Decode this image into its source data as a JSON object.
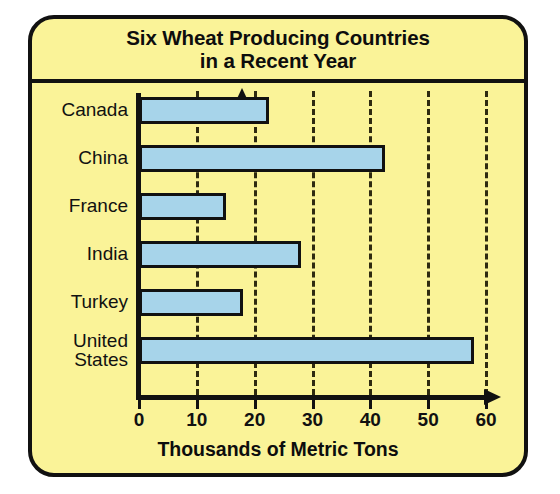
{
  "figure": {
    "title_line1": "Six Wheat Producing Countries",
    "title_line2": "in a Recent Year",
    "background_color": "#faf398",
    "border_color": "#111111",
    "bar_fill_color": "#a7d4ea"
  },
  "chart_data": {
    "type": "bar",
    "orientation": "horizontal",
    "title": "Six Wheat Producing Countries in a Recent Year",
    "categories": [
      "Canada",
      "China",
      "France",
      "India",
      "Turkey",
      "United States"
    ],
    "values": [
      22.5,
      42.5,
      15,
      28,
      18,
      58
    ],
    "xlabel": "Thousands of Metric Tons",
    "ylabel": "",
    "xlim": [
      0,
      60
    ],
    "xticks": [
      0,
      10,
      20,
      30,
      40,
      50,
      60
    ],
    "xtick_labels": [
      "0",
      "10",
      "20",
      "30",
      "40",
      "50",
      "60"
    ],
    "grid": true,
    "grid_style": "dashed-vertical",
    "legend": null,
    "series": [
      {
        "name": "Wheat production",
        "color": "#a7d4ea",
        "values": [
          22.5,
          42.5,
          15,
          28,
          18,
          58
        ]
      }
    ]
  },
  "axis_caption": "Thousands of Metric Tons",
  "category_labels": [
    "Canada",
    "China",
    "France",
    "India",
    "Turkey",
    "United\nStates"
  ]
}
